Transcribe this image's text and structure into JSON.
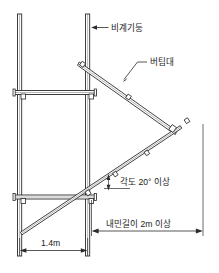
{
  "figure": {
    "kind": "engineering-diagram",
    "background_color": "#ffffff",
    "line_color": "#2b2b2b"
  },
  "labels": {
    "post": "비계기둥",
    "brace": "버팀대",
    "angle": "각도 20° 이상",
    "cantilever": "내민길이 2m 이상",
    "bay_width": "1.4m"
  },
  "annotations": [
    {
      "id": "post-label",
      "text": "비계기둥",
      "points_to": "vertical-post-right"
    },
    {
      "id": "brace-label",
      "text": "버팀대",
      "points_to": "upper-diagonal-brace"
    },
    {
      "id": "angle-label",
      "text": "각도 20° 이상",
      "points_to": "lower-diagonal-brace"
    },
    {
      "id": "cantilever-label",
      "text": "내민길이 2m 이상",
      "points_to": "cantilever-dimension"
    },
    {
      "id": "bay-label",
      "text": "1.4m",
      "points_to": "bay-dimension"
    }
  ],
  "members": {
    "vertical_posts": 2,
    "horizontal_ledgers": 2,
    "diagonal_braces": 2,
    "coupler_count": 8
  }
}
